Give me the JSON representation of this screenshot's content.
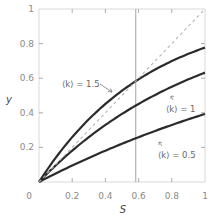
{
  "chart_data": {
    "type": "line",
    "title": "",
    "xlabel": "S",
    "ylabel": "y",
    "xlim": [
      0,
      1
    ],
    "ylim": [
      0,
      1
    ],
    "grid": false,
    "x_ticks": [
      "0",
      "0.2",
      "0.4",
      "0.6",
      "0.8",
      "1"
    ],
    "y_ticks": [
      "0.2",
      "0.4",
      "0.6",
      "0.8",
      "1"
    ],
    "x": [
      0,
      0.1,
      0.2,
      0.3,
      0.4,
      0.5,
      0.6,
      0.7,
      0.8,
      0.9,
      1.0
    ],
    "series": [
      {
        "name": "⟨k⟩ = 1.5",
        "k": 1.5,
        "values": [
          0,
          0.139,
          0.259,
          0.362,
          0.451,
          0.528,
          0.593,
          0.65,
          0.699,
          0.741,
          0.777
        ]
      },
      {
        "name": "⟨k⟩ = 1",
        "k": 1.0,
        "values": [
          0,
          0.095,
          0.181,
          0.259,
          0.33,
          0.393,
          0.451,
          0.503,
          0.551,
          0.593,
          0.632
        ]
      },
      {
        "name": "⟨k⟩ = 0.5",
        "k": 0.5,
        "values": [
          0,
          0.049,
          0.095,
          0.139,
          0.181,
          0.221,
          0.259,
          0.295,
          0.33,
          0.362,
          0.393
        ]
      },
      {
        "name": "y = S (dashed)",
        "values": [
          0,
          0.1,
          0.2,
          0.3,
          0.4,
          0.5,
          0.6,
          0.7,
          0.8,
          0.9,
          1.0
        ],
        "style": "dashed"
      }
    ],
    "annotations": [
      {
        "text": "⟨k⟩ = 1.5",
        "target_series": 0
      },
      {
        "text": "⟨k⟩ = 1",
        "target_series": 1
      },
      {
        "text": "⟨k⟩ = 0.5",
        "target_series": 2
      }
    ],
    "vertical_line": {
      "x": 0.583
    },
    "colors": {
      "curves": "#2b2b2b",
      "dashed": "#b5b5b5",
      "axis": "#c8c8c8",
      "vline": "#9a9a9a"
    }
  }
}
